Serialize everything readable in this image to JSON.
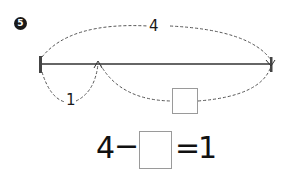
{
  "problem": {
    "number": "5",
    "total_label": "4",
    "part_label": "1",
    "unknown_box": ""
  },
  "equation": {
    "left": "4",
    "operator": "−",
    "blank": "",
    "equals": "=",
    "right": "1"
  },
  "colors": {
    "line": "#333333",
    "dashed": "#555555",
    "box_border": "#9a9a9a"
  }
}
